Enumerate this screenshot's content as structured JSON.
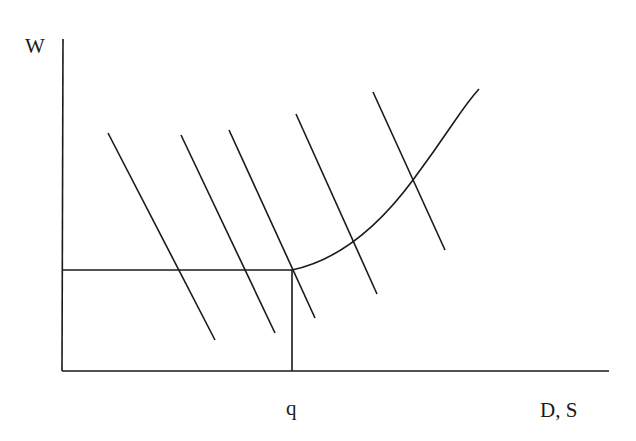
{
  "diagram": {
    "labels": {
      "y_axis": "W",
      "x_axis": "D, S",
      "x_marker": "q"
    },
    "axes": {
      "origin": [
        62,
        371
      ],
      "y_top": [
        63,
        39
      ],
      "x_right": [
        609,
        371
      ]
    },
    "reference_lines": {
      "horizontal": {
        "from": [
          62,
          270
        ],
        "to": [
          292,
          270
        ]
      },
      "vertical": {
        "from": [
          292,
          270
        ],
        "to": [
          292,
          371
        ]
      }
    },
    "demand_curves": [
      {
        "name": "D1",
        "from": [
          108,
          133
        ],
        "to": [
          215,
          340
        ]
      },
      {
        "name": "D2",
        "from": [
          181,
          135
        ],
        "to": [
          275,
          333
        ]
      },
      {
        "name": "D3",
        "from": [
          229,
          130
        ],
        "to": [
          315,
          318
        ]
      },
      {
        "name": "D4",
        "from": [
          296,
          114
        ],
        "to": [
          377,
          294
        ]
      },
      {
        "name": "D5",
        "from": [
          373,
          92
        ],
        "to": [
          445,
          250
        ]
      }
    ],
    "supply_curve": {
      "name": "S",
      "shape": "horizontal up to q, then convex rising",
      "path": "M292,270 C330,262 370,238 413,180 S460,110 479,89"
    },
    "stroke_color": "#1a1a1a"
  }
}
